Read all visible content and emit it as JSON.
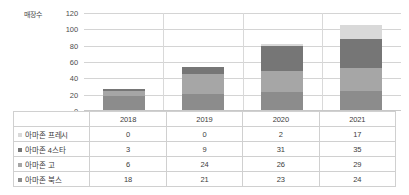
{
  "chart_data": {
    "type": "bar",
    "subtype": "stacked-column",
    "title": "",
    "xlabel": "",
    "ylabel": "매장수",
    "categories": [
      "2018",
      "2019",
      "2020",
      "2021"
    ],
    "ylim": [
      0,
      120
    ],
    "yticks": [
      0,
      20,
      40,
      60,
      80,
      100,
      120
    ],
    "grid": true,
    "legend_position": "table-below",
    "stack_order_bottom_to_top": [
      "아마존 북스",
      "아마존 고",
      "아마존 4스타",
      "아마존 프레시"
    ],
    "series": [
      {
        "name": "아마존 프레시",
        "values": [
          0,
          0,
          2,
          17
        ],
        "color": "#d9d9d9"
      },
      {
        "name": "아마존 4스타",
        "values": [
          3,
          9,
          31,
          35
        ],
        "color": "#767676"
      },
      {
        "name": "아마존 고",
        "values": [
          6,
          24,
          26,
          29
        ],
        "color": "#a6a6a6"
      },
      {
        "name": "아마존 북스",
        "values": [
          18,
          21,
          23,
          24
        ],
        "color": "#8c8c8c"
      }
    ],
    "totals": [
      27,
      54,
      82,
      105
    ]
  },
  "table": {
    "corner_label": "",
    "column_headers": [
      "2018",
      "2019",
      "2020",
      "2021"
    ],
    "rows": [
      {
        "label": "아마존 프레시",
        "marker_color": "#d9d9d9",
        "values": [
          "0",
          "0",
          "2",
          "17"
        ]
      },
      {
        "label": "아마존 4스타",
        "marker_color": "#767676",
        "values": [
          "3",
          "9",
          "31",
          "35"
        ]
      },
      {
        "label": "아마존 고",
        "marker_color": "#a6a6a6",
        "values": [
          "6",
          "24",
          "26",
          "29"
        ]
      },
      {
        "label": "아마존 북스",
        "marker_color": "#8c8c8c",
        "values": [
          "18",
          "21",
          "23",
          "24"
        ]
      }
    ]
  },
  "axis": {
    "y_title": "매장수",
    "ticks": [
      "120",
      "100",
      "80",
      "60",
      "40",
      "20",
      "0"
    ]
  },
  "colors": {
    "grid": "#d4d4d4",
    "border": "#d0d0d0",
    "text": "#3d3d3d",
    "background": "#ffffff"
  }
}
